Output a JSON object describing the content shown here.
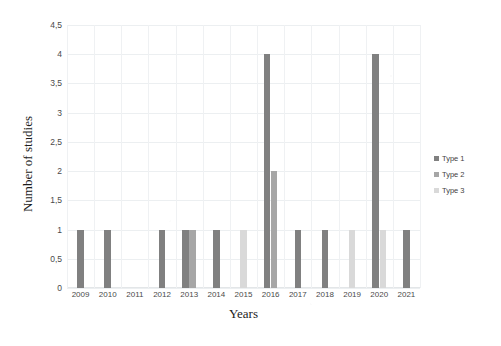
{
  "chart_data": {
    "type": "bar",
    "title": "",
    "xlabel": "Years",
    "ylabel": "Number of studies",
    "categories": [
      "2009",
      "2010",
      "2011",
      "2012",
      "2013",
      "2014",
      "2015",
      "2016",
      "2017",
      "2018",
      "2019",
      "2020",
      "2021"
    ],
    "series": [
      {
        "name": "Type 1",
        "color": "#808080",
        "values": [
          1,
          1,
          0,
          1,
          1,
          1,
          0,
          4,
          1,
          1,
          0,
          4,
          1
        ]
      },
      {
        "name": "Type 2",
        "color": "#a6a6a6",
        "values": [
          0,
          0,
          0,
          0,
          1,
          0,
          0,
          2,
          0,
          0,
          0,
          0,
          0
        ]
      },
      {
        "name": "Type 3",
        "color": "#d9d9d9",
        "values": [
          0,
          0,
          0,
          0,
          0,
          0,
          1,
          0,
          0,
          0,
          1,
          1,
          0
        ]
      }
    ],
    "ylim": [
      0,
      4.5
    ],
    "ytick_labels": [
      "0",
      "0,5",
      "1",
      "1,5",
      "2",
      "2,5",
      "3",
      "3,5",
      "4",
      "4,5"
    ],
    "ytick_values": [
      0,
      0.5,
      1,
      1.5,
      2,
      2.5,
      3,
      3.5,
      4,
      4.5
    ],
    "grid": true,
    "legend_position": "right",
    "legend_entries": [
      "Type 1",
      "Type 2",
      "Type 3"
    ]
  }
}
